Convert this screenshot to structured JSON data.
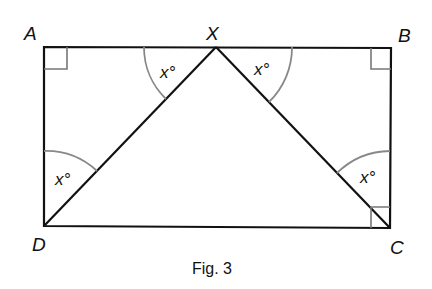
{
  "figure": {
    "caption": "Fig. 3",
    "vertices": {
      "A": "A",
      "X": "X",
      "B": "B",
      "C": "C",
      "D": "D"
    },
    "angle_label": "x°",
    "angles": [
      {
        "at": "X",
        "side": "left",
        "label": "x°"
      },
      {
        "at": "X",
        "side": "right",
        "label": "x°"
      },
      {
        "at": "D",
        "label": "x°"
      },
      {
        "at": "C",
        "label": "x°"
      }
    ],
    "right_angles": [
      "A",
      "B",
      "C"
    ],
    "colors": {
      "line": "#111111",
      "arc": "#888888"
    }
  }
}
